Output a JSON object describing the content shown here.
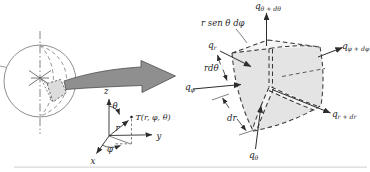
{
  "coordinate_system": {
    "z_label": "z",
    "y_label": "y",
    "x_label": "x",
    "theta_label": "θ",
    "phi_label": "φ",
    "r_label": "r",
    "point_label": "T(r, φ, θ)"
  },
  "element": {
    "dim_width_label": "r sen θ dφ",
    "dim_rdtheta_label": "rdθ",
    "dim_dr_label": "dr",
    "flux_labels": {
      "q_r": {
        "base": "q",
        "sub": "r"
      },
      "q_r_plus_dr": {
        "base": "q",
        "sub": "r + dr"
      },
      "q_theta": {
        "base": "q",
        "sub": "θ"
      },
      "q_theta_plus_dtheta": {
        "base": "q",
        "sub": "θ + dθ"
      },
      "q_phi": {
        "base": "q",
        "sub": "φ"
      },
      "q_phi_plus_dphi": {
        "base": "q",
        "sub": "φ + dφ"
      }
    }
  },
  "colors": {
    "element_fill": "#e4e4e4",
    "element_face_light": "#f4f4f4",
    "zoom_arrow_fill": "#8f8f8f",
    "sphere_element_fill": "#dcdcdc",
    "line": "#2d2d2d",
    "text": "#1f1f1f"
  }
}
